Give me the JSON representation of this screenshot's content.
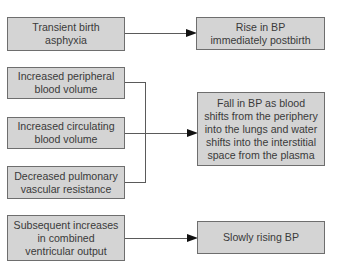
{
  "diagram": {
    "type": "flowchart",
    "causes": [
      {
        "id": "c1",
        "label": "Transient birth asphyxia",
        "lines": [
          "Transient birth",
          "asphyxia"
        ]
      },
      {
        "id": "c2",
        "label": "Increased peripheral blood volume",
        "lines": [
          "Increased peripheral",
          "blood volume"
        ]
      },
      {
        "id": "c3",
        "label": "Increased circulating blood volume",
        "lines": [
          "Increased circulating",
          "blood volume"
        ]
      },
      {
        "id": "c4",
        "label": "Decreased pulmonary vascular resistance",
        "lines": [
          "Decreased pulmonary",
          "vascular resistance"
        ]
      },
      {
        "id": "c5",
        "label": "Subsequent increases in combined ventricular output",
        "lines": [
          "Subsequent increases",
          "in combined",
          "ventricular output"
        ]
      }
    ],
    "effects": [
      {
        "id": "e1",
        "label": "Rise in BP immediately postbirth",
        "lines": [
          "Rise in BP",
          "immediately postbirth"
        ]
      },
      {
        "id": "e2",
        "label": "Fall in BP as blood shifts from the periphery into the lungs and water shifts into the interstitial space from the plasma",
        "lines": [
          "Fall in BP as blood",
          "shifts from the periphery",
          "into the lungs and water",
          "shifts into the interstitial",
          "space from the plasma"
        ]
      },
      {
        "id": "e3",
        "label": "Slowly rising BP",
        "lines": [
          "Slowly rising BP"
        ]
      }
    ],
    "edges": [
      {
        "from": "c1",
        "to": "e1"
      },
      {
        "from": "c2",
        "to": "e2"
      },
      {
        "from": "c3",
        "to": "e2"
      },
      {
        "from": "c4",
        "to": "e2"
      },
      {
        "from": "c5",
        "to": "e3"
      }
    ],
    "colors": {
      "box_fill": "#d4d4d4",
      "box_border": "#6e6e6e",
      "text": "#3a3a3a",
      "connector": "#5a5a5a",
      "arrowhead": "#111111"
    }
  }
}
